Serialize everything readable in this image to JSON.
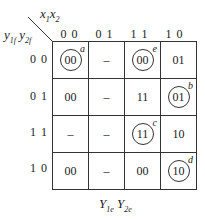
{
  "kmap": {
    "corner_label_top": "x1x2",
    "corner_label_left": "y1f y2f",
    "column_headers": [
      "0 0",
      "0 1",
      "1 1",
      "1 0"
    ],
    "row_headers": [
      "0 0",
      "0 1",
      "1 1",
      "1 0"
    ],
    "cells": [
      [
        {
          "v": "00",
          "circled": true,
          "tag": "a"
        },
        {
          "v": "–",
          "circled": false,
          "tag": ""
        },
        {
          "v": "00",
          "circled": true,
          "tag": "e"
        },
        {
          "v": "01",
          "circled": false,
          "tag": ""
        }
      ],
      [
        {
          "v": "00",
          "circled": false,
          "tag": ""
        },
        {
          "v": "–",
          "circled": false,
          "tag": ""
        },
        {
          "v": "11",
          "circled": false,
          "tag": ""
        },
        {
          "v": "01",
          "circled": true,
          "tag": "b"
        }
      ],
      [
        {
          "v": "–",
          "circled": false,
          "tag": ""
        },
        {
          "v": "–",
          "circled": false,
          "tag": ""
        },
        {
          "v": "11",
          "circled": true,
          "tag": "c"
        },
        {
          "v": "10",
          "circled": false,
          "tag": ""
        }
      ],
      [
        {
          "v": "00",
          "circled": false,
          "tag": ""
        },
        {
          "v": "–",
          "circled": false,
          "tag": ""
        },
        {
          "v": "00",
          "circled": false,
          "tag": ""
        },
        {
          "v": "10",
          "circled": true,
          "tag": "d"
        }
      ]
    ],
    "footer_label": "Y1e Y2e"
  }
}
